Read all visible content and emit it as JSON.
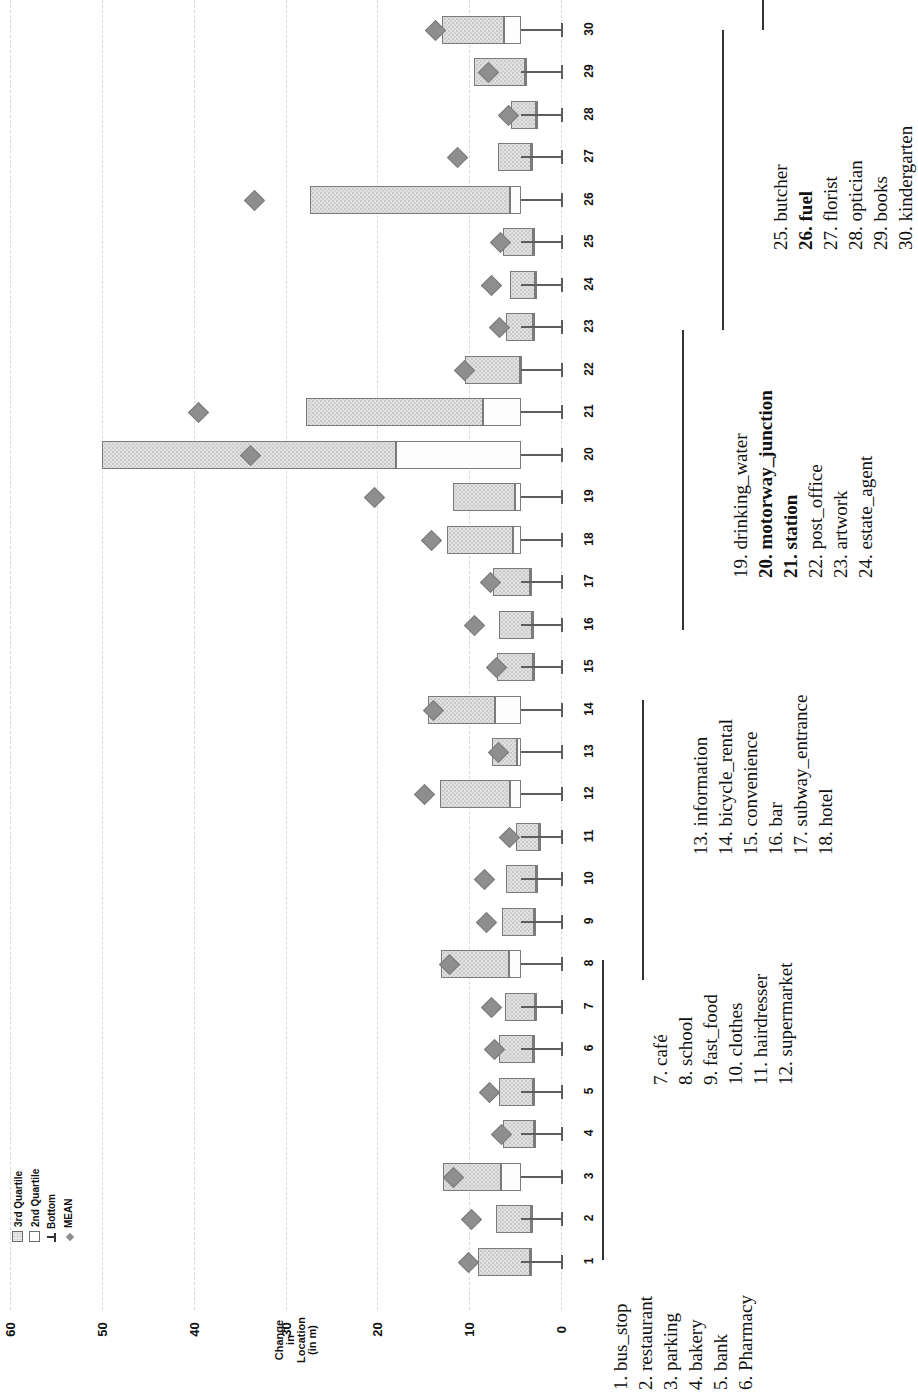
{
  "axis": {
    "title_lines": [
      "Change",
      "in",
      "Location",
      "(in m)"
    ],
    "ticks": [
      "60",
      "50",
      "40",
      "30",
      "20",
      "10",
      "0"
    ]
  },
  "legend": {
    "items": [
      {
        "symbol": "3rd-quartile-swatch",
        "label": "3rd Quartile"
      },
      {
        "symbol": "2nd-quartile-swatch",
        "label": "2nd Quartile"
      },
      {
        "symbol": "bottom-whisker-symbol",
        "label": "Bottom"
      },
      {
        "symbol": "mean-diamond-symbol",
        "label": "MEAN"
      }
    ]
  },
  "caption_groups": [
    {
      "items": [
        {
          "num": "1.",
          "name": "bus_stop",
          "bold": false
        },
        {
          "num": "2.",
          "name": "restaurant",
          "bold": false
        },
        {
          "num": "3.",
          "name": "parking",
          "bold": false
        },
        {
          "num": "4.",
          "name": "bakery",
          "bold": false
        },
        {
          "num": "5.",
          "name": "bank",
          "bold": false
        },
        {
          "num": "6.",
          "name": "Pharmacy",
          "bold": false
        }
      ]
    },
    {
      "items": [
        {
          "num": "7.",
          "name": "café",
          "bold": false
        },
        {
          "num": "8.",
          "name": "school",
          "bold": false
        },
        {
          "num": "9.",
          "name": "fast_food",
          "bold": false
        },
        {
          "num": "10.",
          "name": "clothes",
          "bold": false
        },
        {
          "num": "11.",
          "name": "hairdresser",
          "bold": false
        },
        {
          "num": "12.",
          "name": "supermarket",
          "bold": false
        }
      ]
    },
    {
      "items": [
        {
          "num": "13.",
          "name": "information",
          "bold": false
        },
        {
          "num": "14.",
          "name": "bicycle_rental",
          "bold": false
        },
        {
          "num": "15.",
          "name": "convenience",
          "bold": false
        },
        {
          "num": "16.",
          "name": "bar",
          "bold": false
        },
        {
          "num": "17.",
          "name": "subway_entrance",
          "bold": false
        },
        {
          "num": "18.",
          "name": "hotel",
          "bold": false
        }
      ]
    },
    {
      "items": [
        {
          "num": "19.",
          "name": "drinking_water",
          "bold": false
        },
        {
          "num": "20.",
          "name": "motorway_junction",
          "bold": true
        },
        {
          "num": "21.",
          "name": "station",
          "bold": true
        },
        {
          "num": "22.",
          "name": "post_office",
          "bold": false
        },
        {
          "num": "23.",
          "name": "artwork",
          "bold": false
        },
        {
          "num": "24.",
          "name": "estate_agent",
          "bold": false
        }
      ]
    },
    {
      "items": [
        {
          "num": "25.",
          "name": "butcher",
          "bold": false
        },
        {
          "num": "26.",
          "name": "fuel",
          "bold": true
        },
        {
          "num": "27.",
          "name": "florist",
          "bold": false
        },
        {
          "num": "28.",
          "name": "optician",
          "bold": false
        },
        {
          "num": "29.",
          "name": "books",
          "bold": false
        },
        {
          "num": "30.",
          "name": "kindergarten",
          "bold": false
        }
      ]
    }
  ],
  "chart_data": {
    "type": "bar",
    "title": "",
    "xlabel": "Change in Location (in m)",
    "ylabel": "",
    "orientation": "horizontal",
    "axis_reversed": true,
    "xlim": [
      0,
      60
    ],
    "xticks": [
      0,
      10,
      20,
      30,
      40,
      50,
      60
    ],
    "grid": true,
    "legend_position": "left",
    "series": [
      {
        "name": "3rd Quartile"
      },
      {
        "name": "2nd Quartile"
      },
      {
        "name": "Bottom"
      },
      {
        "name": "MEAN"
      }
    ],
    "categories": [
      "1. bus_stop",
      "2. restaurant",
      "3. parking",
      "4. bakery",
      "5. bank",
      "6. Pharmacy",
      "7. café",
      "8. school",
      "9. fast_food",
      "10. clothes",
      "11. hairdresser",
      "12. supermarket",
      "13. information",
      "14. bicycle_rental",
      "15. convenience",
      "16. bar",
      "17. subway_entrance",
      "18. hotel",
      "19. drinking_water",
      "20. motorway_junction",
      "21. station",
      "22. post_office",
      "23. artwork",
      "24. estate_agent",
      "25. butcher",
      "26. fuel",
      "27. florist",
      "28. optician",
      "29. books",
      "30. kindergarten"
    ],
    "points": [
      {
        "cat": "1. bus_stop",
        "top": 9.0,
        "q2": 3.4,
        "bottom": 0.5,
        "mean": 10.2
      },
      {
        "cat": "2. restaurant",
        "top": 7.1,
        "q2": 3.3,
        "bottom": 0.6,
        "mean": 9.9
      },
      {
        "cat": "3. parking",
        "top": 12.9,
        "q2": 6.5,
        "bottom": 0.7,
        "mean": 11.9
      },
      {
        "cat": "4. bakery",
        "top": 6.3,
        "q2": 2.9,
        "bottom": 0.6,
        "mean": 6.6
      },
      {
        "cat": "5. bank",
        "top": 6.8,
        "q2": 3.1,
        "bottom": 0.6,
        "mean": 8.0
      },
      {
        "cat": "6. Pharmacy",
        "top": 6.7,
        "q2": 3.0,
        "bottom": 0.6,
        "mean": 7.4
      },
      {
        "cat": "7. café",
        "top": 6.1,
        "q2": 2.8,
        "bottom": 0.6,
        "mean": 7.7
      },
      {
        "cat": "8. school",
        "top": 13.1,
        "q2": 5.7,
        "bottom": 0.7,
        "mean": 12.3
      },
      {
        "cat": "9. fast_food",
        "top": 6.4,
        "q2": 2.9,
        "bottom": 0.6,
        "mean": 8.3
      },
      {
        "cat": "10. clothes",
        "top": 6.0,
        "q2": 2.7,
        "bottom": 0.6,
        "mean": 8.5
      },
      {
        "cat": "11. hairdresser",
        "top": 4.9,
        "q2": 2.4,
        "bottom": 0.5,
        "mean": 5.8
      },
      {
        "cat": "12. supermarket",
        "top": 13.2,
        "q2": 5.6,
        "bottom": 0.8,
        "mean": 15.0
      },
      {
        "cat": "13. information",
        "top": 7.5,
        "q2": 4.8,
        "bottom": 0.7,
        "mean": 7.0
      },
      {
        "cat": "14. bicycle_rental",
        "top": 14.5,
        "q2": 7.2,
        "bottom": 0.8,
        "mean": 14.0
      },
      {
        "cat": "15. convenience",
        "top": 7.0,
        "q2": 3.0,
        "bottom": 0.6,
        "mean": 7.2
      },
      {
        "cat": "16. bar",
        "top": 6.7,
        "q2": 3.2,
        "bottom": 0.6,
        "mean": 9.6
      },
      {
        "cat": "17. subway_entrance",
        "top": 7.4,
        "q2": 3.4,
        "bottom": 0.6,
        "mean": 7.8
      },
      {
        "cat": "18. hotel",
        "top": 12.4,
        "q2": 5.2,
        "bottom": 0.7,
        "mean": 14.3
      },
      {
        "cat": "19. drinking_water",
        "top": 11.8,
        "q2": 5.0,
        "bottom": 0.7,
        "mean": 20.5
      },
      {
        "cat": "20. motorway_junction",
        "top": 50.0,
        "q2": 18.0,
        "bottom": 0.9,
        "mean": 34.0
      },
      {
        "cat": "21. station",
        "top": 27.8,
        "q2": 8.5,
        "bottom": 0.9,
        "mean": 39.6
      },
      {
        "cat": "22. post_office",
        "top": 10.4,
        "q2": 4.5,
        "bottom": 0.7,
        "mean": 10.7
      },
      {
        "cat": "23. artwork",
        "top": 6.0,
        "q2": 3.1,
        "bottom": 0.6,
        "mean": 6.9
      },
      {
        "cat": "24. estate_agent",
        "top": 5.6,
        "q2": 2.8,
        "bottom": 0.6,
        "mean": 7.7
      },
      {
        "cat": "25. butcher",
        "top": 6.3,
        "q2": 3.0,
        "bottom": 0.6,
        "mean": 6.8
      },
      {
        "cat": "26. fuel",
        "top": 27.3,
        "q2": 5.5,
        "bottom": 0.9,
        "mean": 33.5
      },
      {
        "cat": "27. florist",
        "top": 6.9,
        "q2": 3.3,
        "bottom": 0.6,
        "mean": 11.4
      },
      {
        "cat": "28. optician",
        "top": 5.4,
        "q2": 2.7,
        "bottom": 0.6,
        "mean": 5.9
      },
      {
        "cat": "29. books",
        "top": 9.5,
        "q2": 3.9,
        "bottom": 0.7,
        "mean": 8.1
      },
      {
        "cat": "30. kindergarten",
        "top": 13.0,
        "q2": 6.2,
        "bottom": 0.8,
        "mean": 13.8
      }
    ]
  }
}
